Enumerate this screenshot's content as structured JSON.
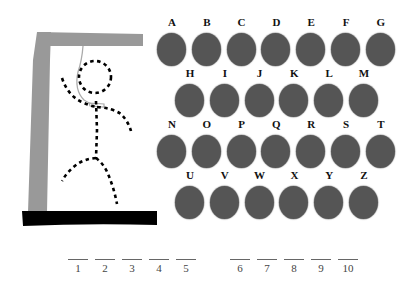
{
  "colors": {
    "background": "#ffffff",
    "gallows_post": "#999999",
    "gallows_base": "#000000",
    "rope": "#aaaaaa",
    "figure": "#000000",
    "letter_button": "#555555",
    "letter_label": "#111111",
    "blank_line": "#666666"
  },
  "gallows": {
    "parts": [
      "post",
      "beam",
      "base",
      "rope",
      "noose"
    ]
  },
  "hangman_figure": {
    "parts_drawn": [
      "head",
      "body",
      "left-arm",
      "right-arm",
      "left-leg",
      "right-leg"
    ],
    "style": "dashed"
  },
  "keyboard": {
    "rows": [
      {
        "offset": 0,
        "letters": [
          "A",
          "B",
          "C",
          "D",
          "E",
          "F",
          "G"
        ]
      },
      {
        "offset": 18,
        "letters": [
          "H",
          "I",
          "J",
          "K",
          "L",
          "M"
        ]
      },
      {
        "offset": 0,
        "letters": [
          "N",
          "O",
          "P",
          "Q",
          "R",
          "S",
          "T"
        ]
      },
      {
        "offset": 18,
        "letters": [
          "U",
          "V",
          "W",
          "X",
          "Y",
          "Z"
        ]
      }
    ]
  },
  "word": {
    "groups": [
      {
        "blanks": [
          "1",
          "2",
          "3",
          "4",
          "5"
        ]
      },
      {
        "blanks": [
          "6",
          "7",
          "8",
          "9",
          "10"
        ]
      }
    ]
  }
}
